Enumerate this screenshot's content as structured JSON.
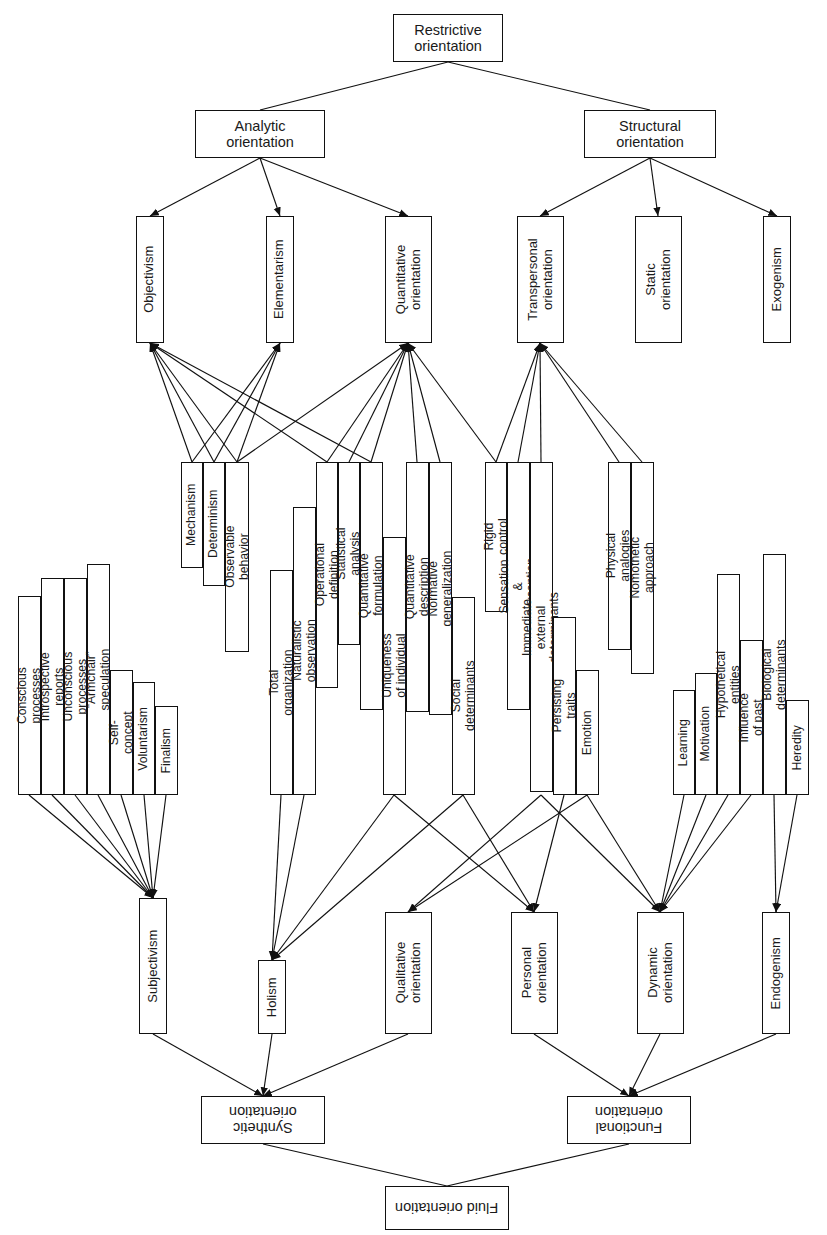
{
  "diagram": {
    "stroke_color": "#111111",
    "background_color": "#ffffff",
    "nodes": [
      {
        "id": "restrictive",
        "label": "Restrictive\norientation",
        "x": 393,
        "y": 14,
        "w": 110,
        "h": 48,
        "orient": "h",
        "size": "fs14"
      },
      {
        "id": "analytic",
        "label": "Analytic\norientation",
        "x": 195,
        "y": 110,
        "w": 130,
        "h": 48,
        "orient": "h",
        "size": "fs14"
      },
      {
        "id": "structural",
        "label": "Structural\norientation",
        "x": 584,
        "y": 110,
        "w": 132,
        "h": 48,
        "orient": "h",
        "size": "fs14"
      },
      {
        "id": "objectivism",
        "label": "Objectivism",
        "x": 136,
        "y": 216,
        "w": 28,
        "h": 127,
        "orient": "v",
        "size": "fs13"
      },
      {
        "id": "elementarism",
        "label": "Elementarism",
        "x": 266,
        "y": 216,
        "w": 28,
        "h": 127,
        "orient": "v",
        "size": "fs13"
      },
      {
        "id": "quantitative",
        "label": "Quantitative\norientation",
        "x": 385,
        "y": 216,
        "w": 47,
        "h": 127,
        "orient": "v",
        "size": "fs13"
      },
      {
        "id": "transpersonal",
        "label": "Transpersonal\norientation",
        "x": 517,
        "y": 216,
        "w": 47,
        "h": 127,
        "orient": "v",
        "size": "fs13"
      },
      {
        "id": "static",
        "label": "Static\norientation",
        "x": 635,
        "y": 216,
        "w": 47,
        "h": 127,
        "orient": "v",
        "size": "fs13"
      },
      {
        "id": "exogenism",
        "label": "Exogenism",
        "x": 763,
        "y": 216,
        "w": 28,
        "h": 127,
        "orient": "v",
        "size": "fs13"
      },
      {
        "id": "mechanism",
        "label": "Mechanism",
        "x": 181,
        "y": 462,
        "w": 22,
        "h": 106,
        "orient": "v",
        "size": "fs12"
      },
      {
        "id": "determinism",
        "label": "Determinism",
        "x": 203,
        "y": 462,
        "w": 22,
        "h": 124,
        "orient": "v",
        "size": "fs12"
      },
      {
        "id": "observable",
        "label": "Observable behavior",
        "x": 225,
        "y": 462,
        "w": 24,
        "h": 190,
        "orient": "v",
        "size": "fs12"
      },
      {
        "id": "total_org",
        "label": "Total organization",
        "x": 270,
        "y": 570,
        "w": 23,
        "h": 225,
        "orient": "v",
        "size": "fs12"
      },
      {
        "id": "naturalistic",
        "label": "Naturalistic observation",
        "x": 293,
        "y": 507,
        "w": 23,
        "h": 288,
        "orient": "v",
        "size": "fs12"
      },
      {
        "id": "operational",
        "label": "Operational definition",
        "x": 316,
        "y": 462,
        "w": 22,
        "h": 226,
        "orient": "v",
        "size": "fs12"
      },
      {
        "id": "statistical",
        "label": "Statistical analysis",
        "x": 338,
        "y": 462,
        "w": 22,
        "h": 183,
        "orient": "v",
        "size": "fs12"
      },
      {
        "id": "quant_form",
        "label": "Quantitative formulation",
        "x": 360,
        "y": 462,
        "w": 23,
        "h": 248,
        "orient": "v",
        "size": "fs12"
      },
      {
        "id": "uniqueness",
        "label": "Uniqueness of individual",
        "x": 383,
        "y": 537,
        "w": 23,
        "h": 258,
        "orient": "v",
        "size": "fs12"
      },
      {
        "id": "quant_desc",
        "label": "Quantitative description",
        "x": 406,
        "y": 462,
        "w": 23,
        "h": 250,
        "orient": "v",
        "size": "fs12"
      },
      {
        "id": "normative",
        "label": "Normative generalization",
        "x": 429,
        "y": 462,
        "w": 23,
        "h": 253,
        "orient": "v",
        "size": "fs12"
      },
      {
        "id": "social_det",
        "label": "Social determinants",
        "x": 452,
        "y": 597,
        "w": 23,
        "h": 198,
        "orient": "v",
        "size": "fs12"
      },
      {
        "id": "rigid",
        "label": "Rigid control",
        "x": 485,
        "y": 462,
        "w": 22,
        "h": 150,
        "orient": "v",
        "size": "fs12"
      },
      {
        "id": "sensation",
        "label": "Sensation & perception",
        "x": 507,
        "y": 462,
        "w": 23,
        "h": 248,
        "orient": "v",
        "size": "fs12"
      },
      {
        "id": "immediate",
        "label": "Immediate external determinants",
        "x": 530,
        "y": 462,
        "w": 23,
        "h": 330,
        "orient": "v",
        "size": "fs12"
      },
      {
        "id": "persisting",
        "label": "Persisting traits",
        "x": 553,
        "y": 617,
        "w": 23,
        "h": 178,
        "orient": "v",
        "size": "fs12"
      },
      {
        "id": "emotion",
        "label": "Emotion",
        "x": 576,
        "y": 670,
        "w": 23,
        "h": 125,
        "orient": "v",
        "size": "fs12"
      },
      {
        "id": "physical_an",
        "label": "Physical analogies",
        "x": 608,
        "y": 462,
        "w": 23,
        "h": 188,
        "orient": "v",
        "size": "fs12"
      },
      {
        "id": "nomothetic",
        "label": "Nomothetic approach",
        "x": 631,
        "y": 462,
        "w": 23,
        "h": 212,
        "orient": "v",
        "size": "fs12"
      },
      {
        "id": "learning",
        "label": "Learning",
        "x": 673,
        "y": 690,
        "w": 22,
        "h": 105,
        "orient": "v",
        "size": "fs12"
      },
      {
        "id": "motivation",
        "label": "Motivation",
        "x": 695,
        "y": 673,
        "w": 22,
        "h": 122,
        "orient": "v",
        "size": "fs12"
      },
      {
        "id": "hypothetical",
        "label": "Hypothetical entities",
        "x": 717,
        "y": 574,
        "w": 23,
        "h": 221,
        "orient": "v",
        "size": "fs12"
      },
      {
        "id": "influence_past",
        "label": "Influence of past",
        "x": 740,
        "y": 640,
        "w": 23,
        "h": 155,
        "orient": "v",
        "size": "fs12"
      },
      {
        "id": "biological",
        "label": "Biological determinants",
        "x": 763,
        "y": 554,
        "w": 23,
        "h": 241,
        "orient": "v",
        "size": "fs12"
      },
      {
        "id": "heredity",
        "label": "Heredity",
        "x": 786,
        "y": 700,
        "w": 23,
        "h": 95,
        "orient": "v",
        "size": "fs12"
      },
      {
        "id": "conscious",
        "label": "Conscious processes",
        "x": 18,
        "y": 596,
        "w": 23,
        "h": 199,
        "orient": "v",
        "size": "fs12"
      },
      {
        "id": "introspective",
        "label": "Introspective reports",
        "x": 41,
        "y": 578,
        "w": 23,
        "h": 217,
        "orient": "v",
        "size": "fs12"
      },
      {
        "id": "unconscious",
        "label": "Unconscious processes",
        "x": 64,
        "y": 578,
        "w": 23,
        "h": 217,
        "orient": "v",
        "size": "fs12"
      },
      {
        "id": "armchair",
        "label": "“Armchair” speculation",
        "x": 87,
        "y": 564,
        "w": 23,
        "h": 231,
        "orient": "v",
        "size": "fs12"
      },
      {
        "id": "self_concept",
        "label": "Self-concept",
        "x": 110,
        "y": 670,
        "w": 23,
        "h": 125,
        "orient": "v",
        "size": "fs12"
      },
      {
        "id": "voluntarism",
        "label": "Voluntarism",
        "x": 133,
        "y": 682,
        "w": 22,
        "h": 113,
        "orient": "v",
        "size": "fs12"
      },
      {
        "id": "finalism",
        "label": "Finalism",
        "x": 155,
        "y": 706,
        "w": 23,
        "h": 89,
        "orient": "v",
        "size": "fs12"
      },
      {
        "id": "subjectivism",
        "label": "Subjectivism",
        "x": 139,
        "y": 898,
        "w": 28,
        "h": 136,
        "orient": "v",
        "size": "fs13"
      },
      {
        "id": "holism",
        "label": "Holism",
        "x": 258,
        "y": 960,
        "w": 28,
        "h": 74,
        "orient": "v",
        "size": "fs13"
      },
      {
        "id": "qualitative",
        "label": "Qualitative\norientation",
        "x": 385,
        "y": 912,
        "w": 47,
        "h": 122,
        "orient": "v",
        "size": "fs13"
      },
      {
        "id": "personal",
        "label": "Personal\norientation",
        "x": 511,
        "y": 912,
        "w": 47,
        "h": 122,
        "orient": "v",
        "size": "fs13"
      },
      {
        "id": "dynamic",
        "label": "Dynamic\norientation",
        "x": 637,
        "y": 912,
        "w": 47,
        "h": 122,
        "orient": "v",
        "size": "fs13"
      },
      {
        "id": "endogenism",
        "label": "Endogenism",
        "x": 762,
        "y": 912,
        "w": 28,
        "h": 122,
        "orient": "v",
        "size": "fs13"
      },
      {
        "id": "synthetic",
        "label": "Synthetic\norientation",
        "x": 201,
        "y": 1096,
        "w": 124,
        "h": 48,
        "orient": "r",
        "size": "fs14"
      },
      {
        "id": "functional",
        "label": "Functional\norientation",
        "x": 567,
        "y": 1096,
        "w": 124,
        "h": 48,
        "orient": "r",
        "size": "fs14"
      },
      {
        "id": "fluid",
        "label": "Fluid orientation",
        "x": 385,
        "y": 1186,
        "w": 124,
        "h": 44,
        "orient": "r",
        "size": "fs14"
      }
    ],
    "edges": [
      {
        "from": [
          448,
          62
        ],
        "to": [
          260,
          110
        ],
        "arrow": "none"
      },
      {
        "from": [
          448,
          62
        ],
        "to": [
          650,
          110
        ],
        "arrow": "none"
      },
      {
        "from": [
          260,
          158
        ],
        "to": [
          150,
          216
        ],
        "arrow": "end"
      },
      {
        "from": [
          260,
          158
        ],
        "to": [
          280,
          216
        ],
        "arrow": "end"
      },
      {
        "from": [
          260,
          158
        ],
        "to": [
          408,
          216
        ],
        "arrow": "end"
      },
      {
        "from": [
          650,
          158
        ],
        "to": [
          540,
          216
        ],
        "arrow": "end"
      },
      {
        "from": [
          650,
          158
        ],
        "to": [
          658,
          216
        ],
        "arrow": "end"
      },
      {
        "from": [
          650,
          158
        ],
        "to": [
          777,
          216
        ],
        "arrow": "end"
      },
      {
        "from": [
          192,
          462
        ],
        "to": [
          150,
          343
        ],
        "arrow": "end"
      },
      {
        "from": [
          214,
          462
        ],
        "to": [
          150,
          343
        ],
        "arrow": "end"
      },
      {
        "from": [
          237,
          462
        ],
        "to": [
          150,
          343
        ],
        "arrow": "end"
      },
      {
        "from": [
          327,
          462
        ],
        "to": [
          150,
          343
        ],
        "arrow": "end"
      },
      {
        "from": [
          371,
          462
        ],
        "to": [
          150,
          343
        ],
        "arrow": "end"
      },
      {
        "from": [
          192,
          462
        ],
        "to": [
          280,
          343
        ],
        "arrow": "end"
      },
      {
        "from": [
          214,
          462
        ],
        "to": [
          280,
          343
        ],
        "arrow": "end"
      },
      {
        "from": [
          237,
          462
        ],
        "to": [
          280,
          343
        ],
        "arrow": "end"
      },
      {
        "from": [
          327,
          462
        ],
        "to": [
          408,
          343
        ],
        "arrow": "end"
      },
      {
        "from": [
          349,
          462
        ],
        "to": [
          408,
          343
        ],
        "arrow": "end"
      },
      {
        "from": [
          371,
          462
        ],
        "to": [
          408,
          343
        ],
        "arrow": "end"
      },
      {
        "from": [
          417,
          462
        ],
        "to": [
          408,
          343
        ],
        "arrow": "end"
      },
      {
        "from": [
          440,
          462
        ],
        "to": [
          408,
          343
        ],
        "arrow": "end"
      },
      {
        "from": [
          496,
          462
        ],
        "to": [
          408,
          343
        ],
        "arrow": "end"
      },
      {
        "from": [
          237,
          462
        ],
        "to": [
          408,
          343
        ],
        "arrow": "end"
      },
      {
        "from": [
          496,
          462
        ],
        "to": [
          540,
          343
        ],
        "arrow": "end"
      },
      {
        "from": [
          518,
          462
        ],
        "to": [
          540,
          343
        ],
        "arrow": "end"
      },
      {
        "from": [
          541,
          462
        ],
        "to": [
          540,
          343
        ],
        "arrow": "end"
      },
      {
        "from": [
          619,
          462
        ],
        "to": [
          540,
          343
        ],
        "arrow": "end"
      },
      {
        "from": [
          642,
          462
        ],
        "to": [
          540,
          343
        ],
        "arrow": "end"
      },
      {
        "from": [
          29,
          795
        ],
        "to": [
          153,
          898
        ],
        "arrow": "end"
      },
      {
        "from": [
          52,
          795
        ],
        "to": [
          153,
          898
        ],
        "arrow": "end"
      },
      {
        "from": [
          75,
          795
        ],
        "to": [
          153,
          898
        ],
        "arrow": "end"
      },
      {
        "from": [
          98,
          795
        ],
        "to": [
          153,
          898
        ],
        "arrow": "end"
      },
      {
        "from": [
          121,
          795
        ],
        "to": [
          153,
          898
        ],
        "arrow": "end"
      },
      {
        "from": [
          144,
          795
        ],
        "to": [
          153,
          898
        ],
        "arrow": "end"
      },
      {
        "from": [
          166,
          795
        ],
        "to": [
          153,
          898
        ],
        "arrow": "end"
      },
      {
        "from": [
          281,
          795
        ],
        "to": [
          272,
          960
        ],
        "arrow": "end"
      },
      {
        "from": [
          304,
          795
        ],
        "to": [
          272,
          960
        ],
        "arrow": "end"
      },
      {
        "from": [
          394,
          795
        ],
        "to": [
          272,
          960
        ],
        "arrow": "end"
      },
      {
        "from": [
          463,
          795
        ],
        "to": [
          272,
          960
        ],
        "arrow": "end"
      },
      {
        "from": [
          541,
          795
        ],
        "to": [
          408,
          912
        ],
        "arrow": "end"
      },
      {
        "from": [
          587,
          795
        ],
        "to": [
          408,
          912
        ],
        "arrow": "end"
      },
      {
        "from": [
          394,
          795
        ],
        "to": [
          534,
          912
        ],
        "arrow": "end"
      },
      {
        "from": [
          463,
          795
        ],
        "to": [
          534,
          912
        ],
        "arrow": "end"
      },
      {
        "from": [
          564,
          795
        ],
        "to": [
          534,
          912
        ],
        "arrow": "end"
      },
      {
        "from": [
          684,
          795
        ],
        "to": [
          660,
          912
        ],
        "arrow": "end"
      },
      {
        "from": [
          706,
          795
        ],
        "to": [
          660,
          912
        ],
        "arrow": "end"
      },
      {
        "from": [
          728,
          795
        ],
        "to": [
          660,
          912
        ],
        "arrow": "end"
      },
      {
        "from": [
          751,
          795
        ],
        "to": [
          660,
          912
        ],
        "arrow": "end"
      },
      {
        "from": [
          587,
          795
        ],
        "to": [
          660,
          912
        ],
        "arrow": "end"
      },
      {
        "from": [
          541,
          795
        ],
        "to": [
          660,
          912
        ],
        "arrow": "end"
      },
      {
        "from": [
          774,
          795
        ],
        "to": [
          776,
          912
        ],
        "arrow": "end"
      },
      {
        "from": [
          797,
          795
        ],
        "to": [
          776,
          912
        ],
        "arrow": "end"
      },
      {
        "from": [
          153,
          1034
        ],
        "to": [
          263,
          1096
        ],
        "arrow": "end"
      },
      {
        "from": [
          272,
          1034
        ],
        "to": [
          263,
          1096
        ],
        "arrow": "end"
      },
      {
        "from": [
          408,
          1034
        ],
        "to": [
          263,
          1096
        ],
        "arrow": "end"
      },
      {
        "from": [
          534,
          1034
        ],
        "to": [
          629,
          1096
        ],
        "arrow": "end"
      },
      {
        "from": [
          660,
          1034
        ],
        "to": [
          629,
          1096
        ],
        "arrow": "end"
      },
      {
        "from": [
          776,
          1034
        ],
        "to": [
          629,
          1096
        ],
        "arrow": "end"
      },
      {
        "from": [
          263,
          1144
        ],
        "to": [
          447,
          1186
        ],
        "arrow": "none"
      },
      {
        "from": [
          629,
          1144
        ],
        "to": [
          447,
          1186
        ],
        "arrow": "none"
      }
    ]
  }
}
